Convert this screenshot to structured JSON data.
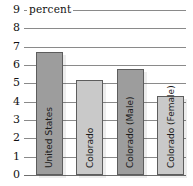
{
  "chart_data": {
    "type": "bar",
    "title": "",
    "subtitle": "",
    "xlabel": "",
    "ylabel": "percent",
    "ylim": [
      0,
      9
    ],
    "yticks": [
      "0",
      "1",
      "2",
      "3",
      "4",
      "5",
      "6",
      "7",
      "8",
      "9"
    ],
    "grid": true,
    "legend": "none",
    "categories": [
      "United States",
      "Colorado",
      "Colorado (Male)",
      "Colorado (Female)"
    ],
    "values": [
      6.7,
      5.2,
      5.8,
      4.3
    ],
    "bar_colors": [
      "#9d9d9d",
      "#c9c9c9",
      "#9d9d9d",
      "#c9c9c9"
    ],
    "bar_border_color": "#5d5d5d"
  },
  "axis": {
    "caption": "percent"
  },
  "bars": [
    {
      "label": "United States",
      "value": 6.7,
      "color": "#9d9d9d",
      "label_inside": true
    },
    {
      "label": "Colorado",
      "value": 5.2,
      "color": "#c9c9c9",
      "label_inside": true
    },
    {
      "label": "Colorado (Male)",
      "value": 5.8,
      "color": "#9d9d9d",
      "label_inside": true
    },
    {
      "label": "Colorado (Female)",
      "value": 4.3,
      "color": "#c9c9c9",
      "label_inside": false
    }
  ],
  "ticks": [
    {
      "label": "9",
      "value": 9
    },
    {
      "label": "8",
      "value": 8
    },
    {
      "label": "7",
      "value": 7
    },
    {
      "label": "6",
      "value": 6
    },
    {
      "label": "5",
      "value": 5
    },
    {
      "label": "4",
      "value": 4
    },
    {
      "label": "3",
      "value": 3
    },
    {
      "label": "2",
      "value": 2
    },
    {
      "label": "1",
      "value": 1
    },
    {
      "label": "0",
      "value": 0
    }
  ]
}
